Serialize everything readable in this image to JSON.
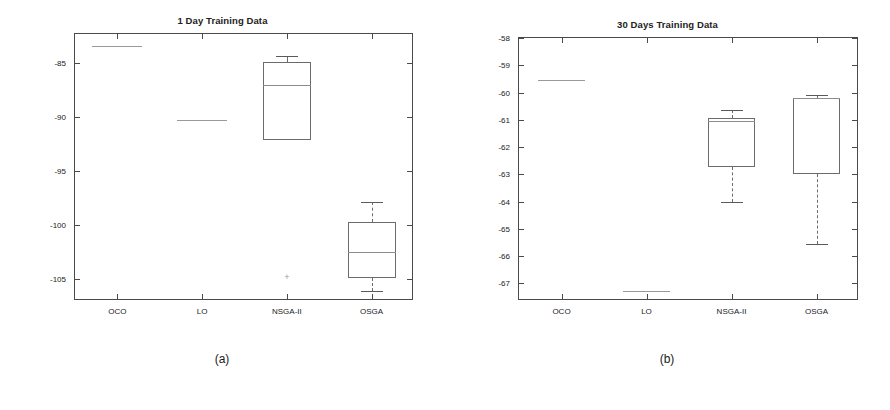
{
  "figure": {
    "subcaptions": [
      {
        "label": "(a)",
        "x": 222,
        "y": 352
      },
      {
        "label": "(b)",
        "x": 667,
        "y": 352
      }
    ]
  },
  "chart_data": [
    {
      "type": "box",
      "panel": "a",
      "title": "1 Day Training Data",
      "xlabel": "",
      "ylabel": "Balance [€]",
      "categories": [
        "OCO",
        "LO",
        "NSGA-II",
        "OSGA"
      ],
      "ylim": [
        -107,
        -82.3
      ],
      "yticks": [
        -85,
        -90,
        -95,
        -100,
        -105
      ],
      "ytick_labels": [
        "-85",
        "-90",
        "-95",
        "-100",
        "-105"
      ],
      "grid": false,
      "legend": null,
      "boxes": [
        {
          "name": "OCO",
          "degenerate": true,
          "median": -83.4,
          "q1": -83.4,
          "q3": -83.4,
          "whisker_low": -83.4,
          "whisker_high": -83.4,
          "outliers": []
        },
        {
          "name": "LO",
          "degenerate": true,
          "median": -90.3,
          "q1": -90.3,
          "q3": -90.3,
          "whisker_low": -90.3,
          "whisker_high": -90.3,
          "outliers": []
        },
        {
          "name": "NSGA-II",
          "degenerate": false,
          "median": -87.0,
          "q1": -92.1,
          "q3": -84.9,
          "whisker_low": -92.1,
          "whisker_high": -84.3,
          "outliers": [
            -104.8
          ]
        },
        {
          "name": "OSGA",
          "degenerate": false,
          "median": -102.5,
          "q1": -104.9,
          "q3": -99.7,
          "whisker_low": -106.1,
          "whisker_high": -97.8,
          "outliers": []
        }
      ]
    },
    {
      "type": "box",
      "panel": "b",
      "title": "30 Days Training Data",
      "xlabel": "",
      "ylabel": "Balance [€]",
      "categories": [
        "OCO",
        "LO",
        "NSGA-II",
        "OSGA"
      ],
      "ylim": [
        -67.65,
        -58.0
      ],
      "yticks": [
        -58,
        -59,
        -60,
        -61,
        -62,
        -63,
        -64,
        -65,
        -66,
        -67
      ],
      "ytick_labels": [
        "-58",
        "-59",
        "-60",
        "-61",
        "-62",
        "-63",
        "-64",
        "-65",
        "-66",
        "-67"
      ],
      "grid": false,
      "legend": null,
      "boxes": [
        {
          "name": "OCO",
          "degenerate": true,
          "median": -59.55,
          "q1": -59.55,
          "q3": -59.55,
          "whisker_low": -59.55,
          "whisker_high": -59.55,
          "outliers": []
        },
        {
          "name": "LO",
          "degenerate": true,
          "median": -67.3,
          "q1": -67.3,
          "q3": -67.3,
          "whisker_low": -67.3,
          "whisker_high": -67.3,
          "outliers": []
        },
        {
          "name": "NSGA-II",
          "degenerate": false,
          "median": -61.05,
          "q1": -62.75,
          "q3": -60.95,
          "whisker_low": -64.0,
          "whisker_high": -60.65,
          "outliers": []
        },
        {
          "name": "OSGA",
          "degenerate": false,
          "median": -60.2,
          "q1": -63.0,
          "q3": -60.2,
          "whisker_low": -65.55,
          "whisker_high": -60.1,
          "outliers": []
        }
      ]
    }
  ]
}
